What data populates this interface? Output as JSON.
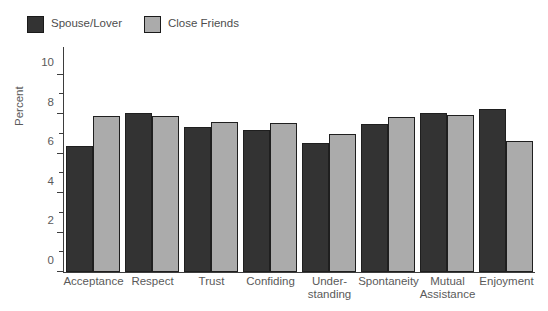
{
  "chart_data": {
    "type": "bar",
    "title": "",
    "xlabel": "",
    "ylabel": "Percent",
    "ylim": [
      0,
      11
    ],
    "y_ticks_major": [
      0,
      2,
      4,
      6,
      8,
      10
    ],
    "y_ticks_minor": [
      1,
      3,
      5,
      7,
      9
    ],
    "grid": false,
    "legend_position": "top-left",
    "categories": [
      "Acceptance",
      "Respect",
      "Trust",
      "Confiding",
      "Under-standing",
      "Spontaneity",
      "Mutual Assistance",
      "Enjoyment"
    ],
    "category_lines": [
      [
        "Acceptance"
      ],
      [
        "Respect"
      ],
      [
        "Trust"
      ],
      [
        "Confiding"
      ],
      [
        "Under-",
        "standing"
      ],
      [
        "Spontaneity"
      ],
      [
        "Mutual",
        "Assistance"
      ],
      [
        "Enjoyment"
      ]
    ],
    "series": [
      {
        "name": "Spouse/Lover",
        "color": "#333333",
        "values": [
          6.4,
          8.05,
          7.35,
          7.2,
          6.55,
          7.5,
          8.05,
          8.25
        ]
      },
      {
        "name": "Close Friends",
        "color": "#ababab",
        "values": [
          7.9,
          7.9,
          7.6,
          7.55,
          7.0,
          7.85,
          7.95,
          6.65
        ]
      }
    ]
  },
  "legend": {
    "entries": [
      {
        "label": "Spouse/Lover",
        "color": "#333333"
      },
      {
        "label": "Close Friends",
        "color": "#ababab"
      }
    ]
  },
  "axis": {
    "y_title": "Percent"
  }
}
